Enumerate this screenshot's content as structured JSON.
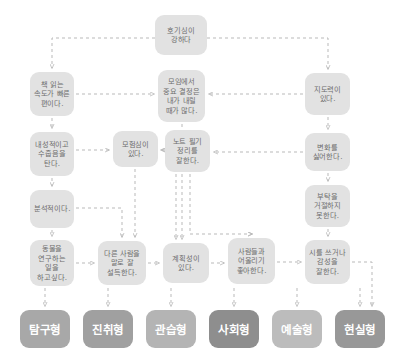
{
  "diagram": {
    "title_node": {
      "id": "curiosity",
      "text": "호기심이 강하다",
      "x": 155,
      "y": 15,
      "w": 52,
      "h": 40
    },
    "nodes": [
      {
        "id": "reading-speed",
        "text": "책 읽는 속도가 빠른 편이다.",
        "x": 30,
        "y": 72,
        "w": 44,
        "h": 44
      },
      {
        "id": "introverted",
        "text": "내성적이고 수줍음을 탄다.",
        "x": 30,
        "y": 132,
        "w": 44,
        "h": 44
      },
      {
        "id": "analytical",
        "text": "분석적이다.",
        "x": 30,
        "y": 190,
        "w": 44,
        "h": 38
      },
      {
        "id": "animal-research",
        "text": "동물을 연구하는 일을 하고싶다.",
        "x": 30,
        "y": 240,
        "w": 44,
        "h": 46
      },
      {
        "id": "adventurous",
        "text": "모험심이 있다.",
        "x": 113,
        "y": 131,
        "w": 45,
        "h": 36
      },
      {
        "id": "persuade",
        "text": "다른 사람을 말로 잘 설득한다.",
        "x": 98,
        "y": 241,
        "w": 48,
        "h": 44
      },
      {
        "id": "group-decision",
        "text": "모임에서 중요 결정은 내가 내릴 때가 많다.",
        "x": 158,
        "y": 70,
        "w": 47,
        "h": 52
      },
      {
        "id": "note-taking",
        "text": "노트 필기 정리를 잘한다.",
        "x": 165,
        "y": 130,
        "w": 45,
        "h": 42
      },
      {
        "id": "planning",
        "text": "계획성이 있다.",
        "x": 163,
        "y": 243,
        "w": 46,
        "h": 40
      },
      {
        "id": "sociable",
        "text": "사람들과 어울리기 좋아한다.",
        "x": 228,
        "y": 238,
        "w": 47,
        "h": 46
      },
      {
        "id": "leadership",
        "text": "지도력이 있다.",
        "x": 305,
        "y": 73,
        "w": 45,
        "h": 42
      },
      {
        "id": "dislike-change",
        "text": "변화를 싫어한다.",
        "x": 305,
        "y": 133,
        "w": 45,
        "h": 38
      },
      {
        "id": "cannot-refuse",
        "text": "부탁을 거절하지 못한다.",
        "x": 305,
        "y": 185,
        "w": 45,
        "h": 42
      },
      {
        "id": "poetry",
        "text": "시를 쓰거나 감성을 잘한다.",
        "x": 305,
        "y": 240,
        "w": 45,
        "h": 44
      }
    ],
    "categories": [
      {
        "id": "investigative",
        "text": "탐구형",
        "x": 20,
        "y": 310,
        "w": 50,
        "h": 38,
        "color": "#a8a8a8"
      },
      {
        "id": "enterprising",
        "text": "진취형",
        "x": 83,
        "y": 310,
        "w": 50,
        "h": 38,
        "color": "#a0a0a0"
      },
      {
        "id": "conventional",
        "text": "관습형",
        "x": 146,
        "y": 310,
        "w": 50,
        "h": 38,
        "color": "#b4b4b4"
      },
      {
        "id": "social",
        "text": "사회형",
        "x": 209,
        "y": 310,
        "w": 50,
        "h": 38,
        "color": "#8e8e8e"
      },
      {
        "id": "artistic",
        "text": "예술형",
        "x": 272,
        "y": 310,
        "w": 50,
        "h": 38,
        "color": "#bcbcbc"
      },
      {
        "id": "realistic",
        "text": "현실형",
        "x": 335,
        "y": 310,
        "w": 50,
        "h": 38,
        "color": "#989898"
      }
    ],
    "edge_color": "#b9b9b9",
    "node_fill": "#e2e2e2",
    "node_text_color": "#6d6d6d",
    "background": "#ffffff",
    "edges": [
      {
        "id": "curiosity-to-reading",
        "d": "M 155 38 L 52 38 L 52 68"
      },
      {
        "id": "curiosity-to-leadership",
        "d": "M 207 38 L 328 38 L 328 69"
      },
      {
        "id": "reading-to-decision",
        "d": "M 76 94 L 154 94"
      },
      {
        "id": "reading-to-introverted",
        "d": "M 52 118 L 52 128"
      },
      {
        "id": "leadership-to-decision",
        "d": "M 303 94 L 209 94"
      },
      {
        "id": "leadership-to-change",
        "d": "M 328 117 L 328 129"
      },
      {
        "id": "introverted-to-adventurous",
        "d": "M 76 150 L 109 150"
      },
      {
        "id": "introverted-to-analytical",
        "d": "M 52 178 L 52 186"
      },
      {
        "id": "decision-to-note",
        "d": "M 182 124 L 182 150 L 161 150"
      },
      {
        "id": "note-to-adventurous",
        "d": "M 163 150 L 162 150"
      },
      {
        "id": "change-to-note",
        "d": "M 303 152 L 214 152"
      },
      {
        "id": "change-to-refuse",
        "d": "M 328 173 L 328 181"
      },
      {
        "id": "analytical-to-animal",
        "d": "M 52 230 L 52 236"
      },
      {
        "id": "analytical-to-persuade",
        "d": "M 76 208 L 122 208 L 122 237"
      },
      {
        "id": "adventurous-to-persuade",
        "d": "M 135 169 L 135 237"
      },
      {
        "id": "animal-to-persuade",
        "d": "M 76 263 L 94 263"
      },
      {
        "id": "persuade-to-planning",
        "d": "M 148 263 L 159 263"
      },
      {
        "id": "decision-down-planning",
        "d": "M 182 174 L 182 239"
      },
      {
        "id": "note-to-sociable",
        "d": "M 190 174 L 190 234 L 252 234"
      },
      {
        "id": "planning-to-sociable",
        "d": "M 211 263 L 224 263"
      },
      {
        "id": "sociable-to-poetry",
        "d": "M 277 262 L 301 262"
      },
      {
        "id": "refuse-down-sociable",
        "d": "M 328 229 L 328 236"
      },
      {
        "id": "sociable-branch-right",
        "d": "M 252 234 L 252 234"
      },
      {
        "id": "investigative-link",
        "d": "M 45 288 L 45 306"
      },
      {
        "id": "enterprising-link",
        "d": "M 108 288 L 108 306"
      },
      {
        "id": "conventional-link",
        "d": "M 171 288 L 171 306"
      },
      {
        "id": "social-link",
        "d": "M 234 288 L 234 306"
      },
      {
        "id": "artistic-link",
        "d": "M 297 288 L 297 306"
      },
      {
        "id": "realistic-link",
        "d": "M 360 288 L 360 306"
      },
      {
        "id": "poetry-to-realistic",
        "d": "M 352 262 L 372 262 L 372 306"
      },
      {
        "id": "note-to-conventional",
        "d": "M 176 174 L 176 200 L 176 239"
      }
    ]
  }
}
